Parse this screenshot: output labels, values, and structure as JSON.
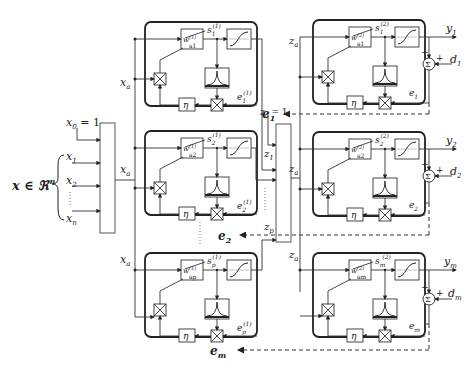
{
  "input": {
    "set_label": "x ∈ ℜ",
    "set_sup": "n",
    "bias": "x",
    "bias_sub": "0",
    "bias_eq": " = 1",
    "inputs": [
      {
        "name": "x",
        "sub": "1"
      },
      {
        "name": "x",
        "sub": "2"
      },
      {
        "name": "x",
        "sub": "n"
      }
    ],
    "bus_out": "x",
    "bus_out_sub": "a"
  },
  "hidden_layer": {
    "units": [
      {
        "id": "1",
        "w": "w",
        "w_sup": "(1)",
        "w_sub": "a1",
        "s": "s",
        "s_sup": "(1)",
        "s_sub": "1",
        "e": "e",
        "e_sup": "(1)",
        "e_sub": "1",
        "eta": "η",
        "fb": "e",
        "fb_sub": "1"
      },
      {
        "id": "2",
        "w": "w",
        "w_sup": "(1)",
        "w_sub": "a2",
        "s": "s",
        "s_sup": "(1)",
        "s_sub": "2",
        "e": "e",
        "e_sup": "(1)",
        "e_sub": "2",
        "eta": "η",
        "fb": "e",
        "fb_sub": "2"
      },
      {
        "id": "p",
        "w": "w",
        "w_sup": "(1)",
        "w_sub": "ap",
        "s": "s",
        "s_sup": "(1)",
        "s_sub": "p",
        "e": "e",
        "e_sup": "(1)",
        "e_sub": "p",
        "eta": "η",
        "fb": "e",
        "fb_sub": "m"
      }
    ]
  },
  "middle_bus": {
    "bias": "z",
    "bias_sub": "0",
    "bias_eq": " = 1",
    "inputs": [
      {
        "name": "z",
        "sub": "1"
      },
      {
        "name": "z",
        "sub": "p"
      }
    ],
    "bus_out": "z",
    "bus_out_sub": "a"
  },
  "output_layer": {
    "units": [
      {
        "id": "1",
        "w": "w",
        "w_sup": "(2)",
        "w_sub": "a1",
        "s": "s",
        "s_sup": "(2)",
        "s_sub": "1",
        "e": "e",
        "e_sub": "1",
        "y": "y",
        "y_sub": "1",
        "d": "d",
        "d_sub": "1",
        "eta": "η",
        "sum": "Σ",
        "minus": "−",
        "plus": "+"
      },
      {
        "id": "2",
        "w": "w",
        "w_sup": "(2)",
        "w_sub": "a2",
        "s": "s",
        "s_sup": "(2)",
        "s_sub": "2",
        "e": "e",
        "e_sub": "2",
        "y": "y",
        "y_sub": "2",
        "d": "d",
        "d_sub": "2",
        "eta": "η",
        "sum": "Σ",
        "minus": "−",
        "plus": "+"
      },
      {
        "id": "m",
        "w": "w",
        "w_sup": "(2)",
        "w_sub": "am",
        "s": "s",
        "s_sup": "(2)",
        "s_sub": "m",
        "e": "e",
        "e_sub": "m",
        "y": "y",
        "y_sub": "m",
        "d": "d",
        "d_sub": "m",
        "eta": "η",
        "sum": "Σ",
        "minus": "−",
        "plus": "+"
      }
    ]
  }
}
